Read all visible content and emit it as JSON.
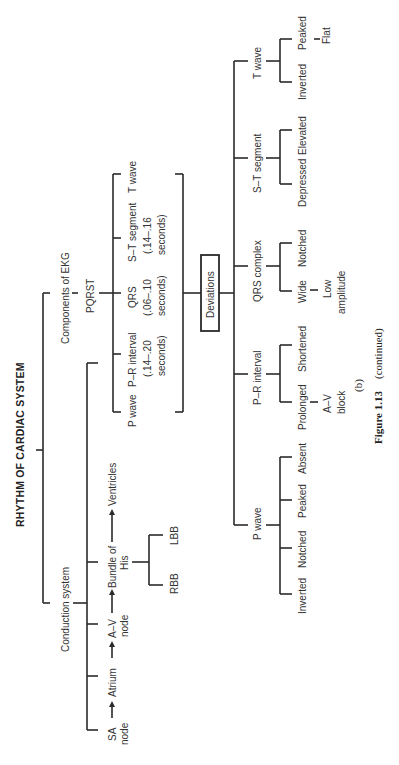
{
  "title": "RHYTHM OF CARDIAC SYSTEM",
  "branches": {
    "components": {
      "label": "Components of EKG",
      "sublabel": "PQRST",
      "items": [
        {
          "name": "P wave",
          "detail1": "",
          "detail2": ""
        },
        {
          "name": "P–R interval",
          "detail1": "(.14–.20",
          "detail2": "seconds)"
        },
        {
          "name": "QRS",
          "detail1": "(.06–.10",
          "detail2": "seconds)"
        },
        {
          "name": "S–T segment",
          "detail1": "(.14–.16",
          "detail2": "seconds)"
        },
        {
          "name": "T wave",
          "detail1": "",
          "detail2": ""
        }
      ]
    },
    "conduction": {
      "label": "Conduction system",
      "path": [
        {
          "line1": "SA",
          "line2": "node"
        },
        {
          "line1": "Atrium",
          "line2": ""
        },
        {
          "line1": "A–V",
          "line2": "node"
        },
        {
          "line1": "Bundle of",
          "line2": "His"
        },
        {
          "line1": "Ventricles",
          "line2": ""
        }
      ],
      "bundle_branches": [
        "RBB",
        "LBB"
      ]
    }
  },
  "deviations": {
    "label": "Deviations",
    "groups": [
      {
        "name": "P wave",
        "items": [
          "Inverted",
          "Notched",
          "Peaked",
          "Absent"
        ],
        "sub": []
      },
      {
        "name": "P–R interval",
        "items": [
          "Prolonged",
          "Shortened"
        ],
        "sub": [
          {
            "parent": "Prolonged",
            "line1": "A–V",
            "line2": "block"
          }
        ]
      },
      {
        "name": "QRS complex",
        "items": [
          "Wide",
          "Notched"
        ],
        "sub": [
          {
            "parent": "Wide",
            "line1": "Low",
            "line2": "amplitude"
          }
        ]
      },
      {
        "name": "S–T segment",
        "items": [
          "Depressed",
          "Elevated"
        ],
        "sub": []
      },
      {
        "name": "T wave",
        "items": [
          "Inverted",
          "Peaked"
        ],
        "sub": [
          {
            "parent": "Peaked",
            "line1": "Flat",
            "line2": ""
          }
        ]
      }
    ]
  },
  "caption": {
    "part": "(b)",
    "figure": "Figure 1.13",
    "note": "(continued)"
  }
}
